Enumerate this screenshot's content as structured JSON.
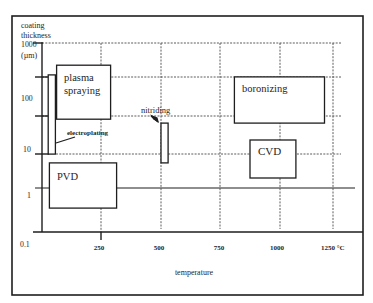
{
  "colors": {
    "ink": "#1e1e1e",
    "paper": "#ffffff",
    "grid": "#4a4a4a"
  },
  "figure": {
    "y_axis": {
      "title_lines": [
        "coating",
        "thickness"
      ],
      "unit": "(µm)",
      "ticks": [
        "1000",
        "100",
        "10",
        "1",
        "0.1"
      ]
    },
    "x_axis": {
      "title": "temperature",
      "ticks": [
        "250",
        "500",
        "750",
        "1000",
        "1250 °C"
      ]
    },
    "labels": {
      "plasma_spraying": [
        "plasma",
        "spraying"
      ],
      "electroplating": "electroplating",
      "nitriding": "nitriding",
      "boronizing": "boronizing",
      "cvd": "CVD",
      "pvd": "PVD"
    }
  },
  "chart_data": {
    "type": "bar",
    "subtype": "floating range boxes (temperature range x thickness range)",
    "title": "",
    "xlabel": "temperature",
    "xunit": "°C",
    "ylabel": "coating thickness",
    "yunit": "µm",
    "yscale": "log",
    "xlim": [
      0,
      1300
    ],
    "ylim": [
      0.1,
      1000
    ],
    "xticks": [
      250,
      500,
      750,
      1000,
      1250
    ],
    "yticks": [
      1000,
      100,
      10,
      1,
      0.1
    ],
    "grid": true,
    "legend": null,
    "series": [
      {
        "id": "plasma_spraying",
        "name": "plasma spraying",
        "temperature": [
          65,
          290
        ],
        "thickness": [
          30,
          360
        ]
      },
      {
        "id": "electroplating",
        "name": "electroplating",
        "temperature": [
          30,
          60
        ],
        "thickness": [
          6,
          230
        ]
      },
      {
        "id": "pvd",
        "name": "PVD",
        "temperature": [
          35,
          315
        ],
        "thickness": [
          0.5,
          4
        ]
      },
      {
        "id": "nitriding",
        "name": "nitriding",
        "temperature": [
          500,
          530
        ],
        "thickness": [
          4,
          25
        ]
      },
      {
        "id": "boronizing",
        "name": "boronizing",
        "temperature": [
          810,
          1210
        ],
        "thickness": [
          25,
          210
        ]
      },
      {
        "id": "cvd",
        "name": "CVD",
        "temperature": [
          875,
          1075
        ],
        "thickness": [
          2,
          11.5
        ]
      }
    ]
  }
}
